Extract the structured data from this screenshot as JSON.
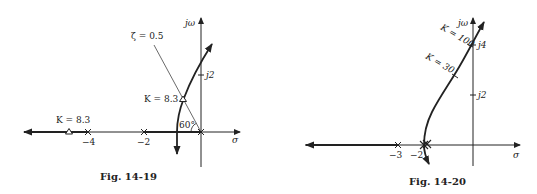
{
  "figures": [
    {
      "caption": "Fig. 14-19",
      "axis_labels": {
        "imag": "jω",
        "real": "σ"
      },
      "imag_ticks": [
        {
          "label": "j2"
        }
      ],
      "real_ticks": [
        {
          "label": "−4"
        },
        {
          "label": "−2"
        }
      ],
      "damping_line_label": "ζ = 0.5",
      "angle_label": "60°",
      "gain_labels": [
        "K = 8.3",
        "K = 8.3"
      ]
    },
    {
      "caption": "Fig. 14-20",
      "axis_labels": {
        "imag": "jω",
        "real": "σ"
      },
      "imag_ticks": [
        {
          "label": "j4"
        },
        {
          "label": "j2"
        }
      ],
      "real_ticks": [
        {
          "label": "−3"
        },
        {
          "label": "−2"
        }
      ],
      "gain_labels": [
        "K = 100",
        "K = 30"
      ]
    }
  ],
  "colors": {
    "ink": "#222222",
    "background": "#ffffff"
  }
}
